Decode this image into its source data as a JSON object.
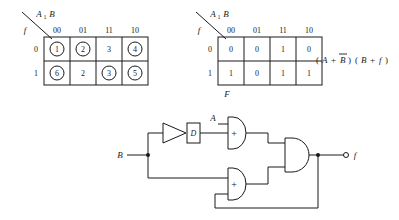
{
  "figure": {
    "title": "",
    "background_color": "#ffffff",
    "ink_color": "#1a1a1a"
  },
  "kmap_left": {
    "name": "excitation-map",
    "corner_label_top": "A",
    "corner_label_top_sub": "1",
    "corner_label_top2": "B",
    "corner_label_bottom": "f",
    "column_headers": [
      "00",
      "01",
      "11",
      "10"
    ],
    "row_headers": [
      "0",
      "1"
    ],
    "caption": "",
    "cells": [
      [
        {
          "value": "1",
          "circled": true
        },
        {
          "value": "2",
          "circled": true
        },
        {
          "value": "3",
          "circled": false
        },
        {
          "value": "4",
          "circled": true
        }
      ],
      [
        {
          "value": "6",
          "circled": true
        },
        {
          "value": "2",
          "circled": false
        },
        {
          "value": "3",
          "circled": true
        },
        {
          "value": "5",
          "circled": true
        }
      ]
    ]
  },
  "kmap_right": {
    "name": "output-map",
    "corner_label_top": "A",
    "corner_label_top_sub": "1",
    "corner_label_top2": "B",
    "corner_label_bottom": "f",
    "column_headers": [
      "00",
      "01",
      "11",
      "10"
    ],
    "row_headers": [
      "0",
      "1"
    ],
    "caption": "F",
    "cells": [
      [
        {
          "value": "0",
          "circled": false
        },
        {
          "value": "0",
          "circled": false
        },
        {
          "value": "1",
          "circled": false
        },
        {
          "value": "0",
          "circled": false
        }
      ],
      [
        {
          "value": "1",
          "circled": false
        },
        {
          "value": "0",
          "circled": false
        },
        {
          "value": "1",
          "circled": false
        },
        {
          "value": "1",
          "circled": false
        }
      ]
    ]
  },
  "equation": {
    "text": "(A + B̅) (B + f)",
    "open_paren": "(",
    "term_a": "A",
    "plus1": "+",
    "term_b_bar": "B",
    "close_paren1": ")",
    "open_paren2": "(",
    "term_b": "B",
    "plus2": "+",
    "term_f": "f",
    "close_paren2": ")"
  },
  "circuit": {
    "name": "logic-circuit",
    "inputs": [
      {
        "label": "B",
        "x": 116,
        "y": 155
      },
      {
        "label": "A",
        "x": 197,
        "y": 118
      }
    ],
    "output": {
      "label": "f",
      "x": 348,
      "y": 155
    },
    "delay_element": {
      "label": "D"
    },
    "gates": [
      {
        "type": "buffer",
        "symbol": ""
      },
      {
        "type": "or",
        "symbol": "+"
      },
      {
        "type": "or",
        "symbol": "+"
      },
      {
        "type": "and",
        "symbol": ""
      }
    ]
  }
}
